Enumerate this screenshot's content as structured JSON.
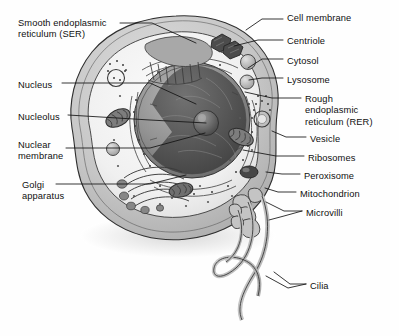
{
  "figure": {
    "type": "labeled-biological-diagram",
    "background_color": "#ffffff",
    "ink_color": "#111111",
    "palette": {
      "cytoplasm_fill": "#f2f2f2",
      "membrane_fill": "#c9c9c9",
      "nucleus_fill": "#8f8f8f",
      "nucleoplasm_dark": "#5a5a5a",
      "nucleolus": "#6e6e6e",
      "organelle_dark": "#7b7b7b",
      "organelle_mid": "#a5a5a5",
      "shadow": "#e3e3e3",
      "outline": "#2a2a2a"
    }
  },
  "labels_left": [
    {
      "id": "ser",
      "text": "Smooth endoplasmic\nreticulum (SER)",
      "x": 18,
      "y": 18
    },
    {
      "id": "nucleus",
      "text": "Nucleus",
      "x": 18,
      "y": 80
    },
    {
      "id": "nucleolus",
      "text": "Nucleolus",
      "x": 18,
      "y": 112
    },
    {
      "id": "nuclear-membrane",
      "text": "Nuclear\nmembrane",
      "x": 18,
      "y": 140
    },
    {
      "id": "golgi",
      "text": "Golgi\napparatus",
      "x": 22,
      "y": 180
    }
  ],
  "labels_right": [
    {
      "id": "cell-membrane",
      "text": "Cell membrane",
      "x": 287,
      "y": 13
    },
    {
      "id": "centriole",
      "text": "Centriole",
      "x": 287,
      "y": 36
    },
    {
      "id": "cytosol",
      "text": "Cytosol",
      "x": 287,
      "y": 56
    },
    {
      "id": "lysosome",
      "text": "Lysosome",
      "x": 287,
      "y": 75
    },
    {
      "id": "rer",
      "text": "Rough\nendoplasmic\nreticulum (RER)",
      "x": 305,
      "y": 94
    },
    {
      "id": "vesicle",
      "text": "Vesicle",
      "x": 310,
      "y": 134
    },
    {
      "id": "ribosomes",
      "text": "Ribosomes",
      "x": 308,
      "y": 153
    },
    {
      "id": "peroxisome",
      "text": "Peroxisome",
      "x": 304,
      "y": 171
    },
    {
      "id": "mitochondrion",
      "text": "Mitochondrion",
      "x": 300,
      "y": 189
    },
    {
      "id": "microvilli",
      "text": "Microvilli",
      "x": 306,
      "y": 208
    },
    {
      "id": "cilia",
      "text": "Cilia",
      "x": 310,
      "y": 281
    }
  ],
  "leader_lines": [
    {
      "id": "ser",
      "d": "M120 23 L152 23 L196 43"
    },
    {
      "id": "nucleus",
      "d": "M62 83 L150 83 L196 104"
    },
    {
      "id": "nucleolus",
      "d": "M68 115 L150 120 L206 123"
    },
    {
      "id": "nuclear-membrane",
      "d": "M66 148 L150 148 L205 133"
    },
    {
      "id": "golgi",
      "d": "M56 184 L150 184 L186 175"
    },
    {
      "id": "cell-membrane",
      "d": "M283 19 L262 19 L246 30"
    },
    {
      "id": "centriole",
      "d": "M283 40 L258 40 L234 46"
    },
    {
      "id": "cytosol",
      "d": "M283 59 L262 59 L248 68"
    },
    {
      "id": "lysosome",
      "d": "M283 78 L262 78 L249 80"
    },
    {
      "id": "rer",
      "d": "M301 98 L272 98 L245 92"
    },
    {
      "id": "vesicle",
      "d": "M306 137 L286 137 L272 131"
    },
    {
      "id": "ribosomes",
      "d": "M304 156 L276 156 L243 150"
    },
    {
      "id": "peroxisome",
      "d": "M300 174 L282 174 L266 172"
    },
    {
      "id": "mitochondrion",
      "d": "M296 192 L278 192 L265 188"
    },
    {
      "id": "microvilli",
      "d": "M302 211 L284 211 L266 202 M302 211 L284 216 L269 220"
    },
    {
      "id": "cilia",
      "d": "M306 284 L290 284 L274 272 M306 284 L288 288 L266 276"
    }
  ],
  "organelles": [
    {
      "id": "nucleus",
      "name": "nucleus"
    },
    {
      "id": "nucleolus",
      "name": "nucleolus"
    },
    {
      "id": "centriole",
      "name": "centriole"
    },
    {
      "id": "lysosome",
      "name": "lysosome"
    },
    {
      "id": "mitochondrion",
      "name": "mitochondrion"
    },
    {
      "id": "peroxisome",
      "name": "peroxisome"
    },
    {
      "id": "golgi",
      "name": "golgi-apparatus"
    },
    {
      "id": "rer",
      "name": "rough-endoplasmic-reticulum"
    },
    {
      "id": "ser",
      "name": "smooth-endoplasmic-reticulum"
    },
    {
      "id": "ribosomes",
      "name": "ribosomes"
    },
    {
      "id": "vesicle",
      "name": "vesicle"
    },
    {
      "id": "microvilli",
      "name": "microvilli"
    },
    {
      "id": "cilia",
      "name": "cilia"
    },
    {
      "id": "cell-membrane",
      "name": "cell-membrane"
    },
    {
      "id": "cytosol",
      "name": "cytosol"
    }
  ]
}
